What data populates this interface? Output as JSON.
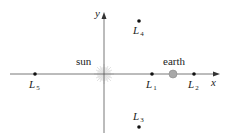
{
  "diagram": {
    "title": "",
    "axes": {
      "x_label": "x",
      "y_label": "y"
    },
    "bodies": {
      "sun": {
        "label": "sun"
      },
      "earth": {
        "label": "earth"
      }
    },
    "lagrange_points": [
      {
        "name": "L",
        "sub": "1"
      },
      {
        "name": "L",
        "sub": "2"
      },
      {
        "name": "L",
        "sub": "3"
      },
      {
        "name": "L",
        "sub": "4"
      },
      {
        "name": "L",
        "sub": "5"
      }
    ],
    "colors": {
      "axis": "#555555",
      "point": "#111111",
      "earth": "#a8a8a8",
      "sun": "#e0e0e0"
    }
  }
}
